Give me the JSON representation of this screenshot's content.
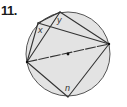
{
  "problem": {
    "number": "11.",
    "labels": {
      "x": "x",
      "y": "y",
      "n": "n"
    }
  },
  "diagram": {
    "circle": {
      "cx": 68,
      "cy": 54,
      "r": 42,
      "fill": "#e3e3e3",
      "stroke": "#555555"
    },
    "points": {
      "Y": [
        60,
        12
      ],
      "X": [
        38,
        23
      ],
      "L": [
        27,
        62
      ],
      "R": [
        109,
        44
      ],
      "B": [
        68,
        97
      ],
      "O": [
        68,
        54
      ]
    },
    "segments": [
      [
        "L",
        "X"
      ],
      [
        "L",
        "Y"
      ],
      [
        "X",
        "Y"
      ],
      [
        "X",
        "R"
      ],
      [
        "Y",
        "R"
      ],
      [
        "L",
        "R"
      ],
      [
        "L",
        "B"
      ],
      [
        "B",
        "R"
      ]
    ]
  }
}
